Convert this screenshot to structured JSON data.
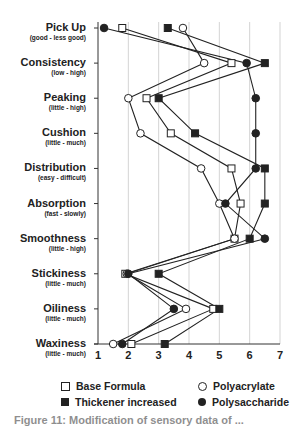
{
  "chart_data": {
    "type": "line",
    "orientation": "horizontal-profile",
    "title": "",
    "xlabel": "",
    "ylabel": "",
    "xlim": [
      1,
      7
    ],
    "x_ticks": [
      "1",
      "2",
      "3",
      "4",
      "5",
      "6",
      "7"
    ],
    "grid": true,
    "categories": [
      {
        "name": "Pick Up",
        "sub": "(good - less good)"
      },
      {
        "name": "Consistency",
        "sub": "(low - high)"
      },
      {
        "name": "Peaking",
        "sub": "(little - high)"
      },
      {
        "name": "Cushion",
        "sub": "(little - much)"
      },
      {
        "name": "Distribution",
        "sub": "(easy - difficult)"
      },
      {
        "name": "Absorption",
        "sub": "(fast - slowly)"
      },
      {
        "name": "Smoothness",
        "sub": "(little - high)"
      },
      {
        "name": "Stickiness",
        "sub": "(little - much)"
      },
      {
        "name": "Oiliness",
        "sub": "(little - much)"
      },
      {
        "name": "Waxiness",
        "sub": "(little - much)"
      }
    ],
    "series": [
      {
        "name": "Base Formula",
        "marker": "open-square",
        "values": [
          1.8,
          5.4,
          2.6,
          3.4,
          5.4,
          5.7,
          5.5,
          1.9,
          4.8,
          2.1
        ]
      },
      {
        "name": "Thickener increased",
        "marker": "filled-square",
        "values": [
          3.3,
          6.5,
          3.0,
          4.2,
          6.5,
          6.5,
          6.0,
          3.0,
          5.0,
          3.2
        ]
      },
      {
        "name": "Polyacrylate",
        "marker": "open-circle",
        "values": [
          3.8,
          4.5,
          2.0,
          2.4,
          4.4,
          5.0,
          5.5,
          1.95,
          3.9,
          1.5
        ]
      },
      {
        "name": "Polysaccharide",
        "marker": "filled-circle",
        "values": [
          1.2,
          5.9,
          6.2,
          6.2,
          6.2,
          5.2,
          6.5,
          2.0,
          3.5,
          1.8
        ]
      }
    ],
    "legend_position": "bottom"
  },
  "legend": {
    "items": [
      {
        "label": "Base Formula",
        "marker": "open-square"
      },
      {
        "label": "Polyacrylate",
        "marker": "open-circle"
      },
      {
        "label": "Thickener increased",
        "marker": "filled-square"
      },
      {
        "label": "Polysaccharide",
        "marker": "filled-circle"
      }
    ]
  },
  "caption": "Figure 11: Modification of sensory data of ..."
}
